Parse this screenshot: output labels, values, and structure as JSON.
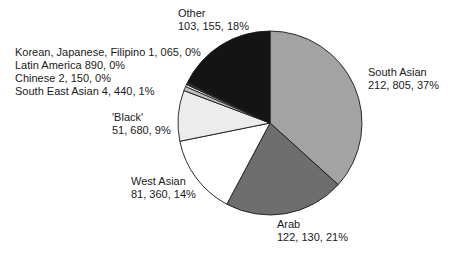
{
  "chart_data": {
    "type": "pie",
    "title": "",
    "start_angle_deg": 0,
    "direction": "clockwise",
    "slices": [
      {
        "name": "South Asian",
        "value": 212805,
        "value_label": "212, 805",
        "percent": 37,
        "color": "#a3a3a3"
      },
      {
        "name": "Arab",
        "value": 122130,
        "value_label": "122, 130",
        "percent": 21,
        "color": "#6e6e6e"
      },
      {
        "name": "West Asian",
        "value": 81360,
        "value_label": "81, 360",
        "percent": 14,
        "color": "#ffffff"
      },
      {
        "name": "'Black'",
        "value": 51680,
        "value_label": "51, 680",
        "percent": 9,
        "color": "#ececec"
      },
      {
        "name": "South East Asian",
        "value": 4440,
        "value_label": "4, 440",
        "percent": 1,
        "color": "#bdbdbd"
      },
      {
        "name": "Chinese",
        "value": 2150,
        "value_label": "2, 150",
        "percent": 0,
        "color": "#ffffff"
      },
      {
        "name": "Latin America",
        "value": 890,
        "value_label": "890",
        "percent": 0,
        "color": "#7a7a7a"
      },
      {
        "name": "Korean, Japanese, Filipino",
        "value": 1065,
        "value_label": "1, 065",
        "percent": 0,
        "color": "#dcdcdc"
      },
      {
        "name": "Other",
        "value": 103155,
        "value_label": "103, 155",
        "percent": 18,
        "color": "#141414"
      }
    ]
  },
  "labels": {
    "other": {
      "line1": "Other",
      "line2": "103, 155, 18%"
    },
    "south_asian": {
      "line1": "South Asian",
      "line2": "212, 805, 37%"
    },
    "arab": {
      "line1": "Arab",
      "line2": "122, 130, 21%"
    },
    "west_asian": {
      "line1": "West Asian",
      "line2": "81, 360, 14%"
    },
    "black": {
      "line1": "'Black'",
      "line2": "51, 680, 9%"
    },
    "korean": "Korean, Japanese, Filipino 1, 065, 0%",
    "latin": "Latin America 890, 0%",
    "chinese": "Chinese 2, 150, 0%",
    "sea": "South East Asian 4, 440, 1%"
  }
}
